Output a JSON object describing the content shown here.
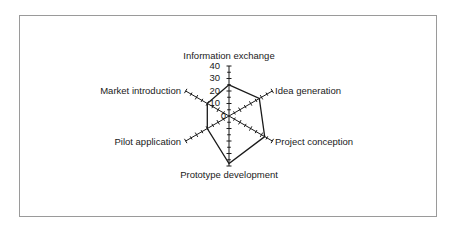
{
  "chart_data": {
    "type": "radar",
    "title": "",
    "categories": [
      "Information exchange",
      "Idea generation",
      "Project conception",
      "Prototype development",
      "Pilot application",
      "Market introduction"
    ],
    "series": [
      {
        "name": "Series 1",
        "values": [
          25,
          28,
          33,
          38,
          20,
          20
        ]
      }
    ],
    "radial_ticks": [
      "0",
      "10",
      "20",
      "30",
      "40"
    ],
    "rlim": [
      0,
      40
    ],
    "grid": false,
    "legend": "none",
    "colors": {
      "line": "#1a1a1a",
      "border": "#9a9a9a",
      "background": "#ffffff"
    }
  }
}
